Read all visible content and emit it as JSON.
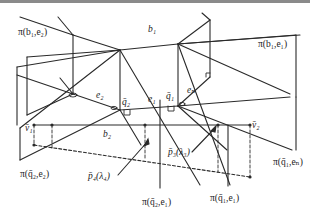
{
  "labels": {
    "pi_b1_e2": "π(b₁,e₂)",
    "pi_b1_e1": "π(b₁,e₁)",
    "b1": "b₁",
    "b2": "b₂",
    "e2": "e₂",
    "e1": "e₁",
    "en": "eₙ",
    "q2": "q̄₂",
    "q1": "q̄₁",
    "v1": "v̄₁",
    "v2": "v̄₂",
    "p4": "p̄₄(λ₄)",
    "p3": "p̄₃(λ₃)",
    "pi_q2_e2": "π(q̄₂,e₂)",
    "pi_q2_e1": "π(q̄₂,e₁)",
    "pi_q1_e1": "π(q̄₁,e₁)",
    "pi_q1_en": "π(q̄₁,eₙ)"
  },
  "colors": {
    "line": "#2a2a2a",
    "topbar": "#8a8a8a",
    "background": "#ffffff"
  }
}
